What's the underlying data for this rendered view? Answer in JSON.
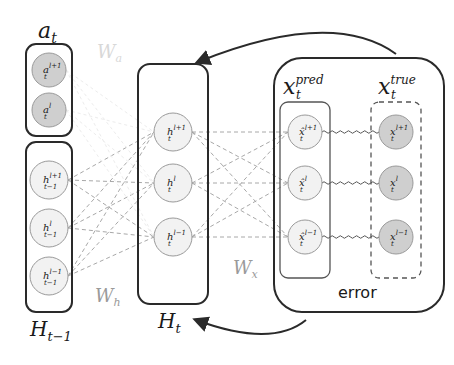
{
  "groups": {
    "a": {
      "label": "a",
      "sub": "t",
      "nodes": [
        {
          "base": "a",
          "sup": "l+1",
          "sub": "t"
        },
        {
          "base": "a",
          "sup": "l",
          "sub": "t"
        }
      ]
    },
    "h_prev": {
      "label": "H",
      "sub": "t−1",
      "nodes": [
        {
          "base": "h",
          "sup": "l+1",
          "sub": "t−1"
        },
        {
          "base": "h",
          "sup": "l",
          "sub": "t−1"
        },
        {
          "base": "h",
          "sup": "l−1",
          "sub": "t−1"
        }
      ]
    },
    "h_t": {
      "label": "H",
      "sub": "t",
      "nodes": [
        {
          "base": "h",
          "sup": "l+1",
          "sub": "t"
        },
        {
          "base": "h",
          "sup": "l",
          "sub": "t"
        },
        {
          "base": "h",
          "sup": "l−1",
          "sub": "t"
        }
      ]
    },
    "x_pred": {
      "label": "x",
      "sup": "pred",
      "sub": "t",
      "nodes": [
        {
          "base": "x̂",
          "sup": "l+1",
          "sub": "t"
        },
        {
          "base": "x̂",
          "sup": "l",
          "sub": "t"
        },
        {
          "base": "x̂",
          "sup": "l−1",
          "sub": "t"
        }
      ]
    },
    "x_true": {
      "label": "x",
      "sup": "true",
      "sub": "t",
      "nodes": [
        {
          "base": "x",
          "sup": "l+1",
          "sub": "t"
        },
        {
          "base": "x",
          "sup": "l",
          "sub": "t"
        },
        {
          "base": "x",
          "sup": "l−1",
          "sub": "t"
        }
      ]
    }
  },
  "weights": {
    "wa": {
      "base": "W",
      "sub": "a"
    },
    "wh": {
      "base": "W",
      "sub": "h"
    },
    "wx": {
      "base": "W",
      "sub": "x"
    }
  },
  "error_label": "error",
  "colors": {
    "stroke": "#2a2a2a",
    "node_fill_light": "#f2f2f2",
    "node_fill_gray": "#cfcfcf",
    "dashed": "#a8a8a8",
    "weight_text": "#9a9a9a",
    "wa_text": "#d8d8d8"
  }
}
